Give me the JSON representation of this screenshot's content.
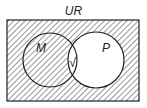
{
  "diagram": {
    "type": "venn",
    "universal_label": "UR",
    "sets": [
      {
        "name": "M",
        "label": "M"
      },
      {
        "name": "P",
        "label": "P"
      }
    ],
    "intersection_mark": "√",
    "shaded_regions": [
      "outside both circles",
      "M only"
    ],
    "unshaded_regions": [
      "M ∩ P",
      "P only"
    ],
    "colors": {
      "line": "#222222",
      "background": "#ffffff"
    }
  }
}
